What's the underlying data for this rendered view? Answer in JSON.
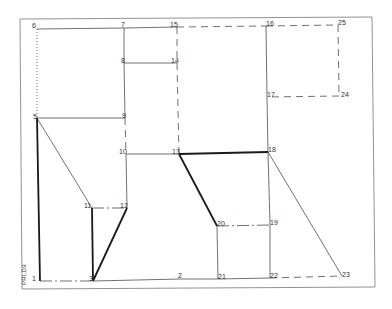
{
  "diagram": {
    "side_label": "PRLD9",
    "colors": {
      "line": "#333333",
      "thick": "#1a1a1a",
      "frame": "#777777",
      "text": "#333333"
    },
    "nodes": [
      {
        "id": "1",
        "x": 40,
        "y": 281,
        "lx": 32,
        "ly": 275
      },
      {
        "id": "2",
        "x": 180,
        "y": 279,
        "lx": 178,
        "ly": 272
      },
      {
        "id": "3",
        "x": 93,
        "y": 281,
        "lx": 89,
        "ly": 275
      },
      {
        "id": "5",
        "x": 37,
        "y": 118,
        "lx": 33,
        "ly": 113
      },
      {
        "id": "6",
        "x": 37,
        "y": 29,
        "lx": 32,
        "ly": 22
      },
      {
        "id": "7",
        "x": 124,
        "y": 28,
        "lx": 121,
        "ly": 21
      },
      {
        "id": "8",
        "x": 124,
        "y": 63,
        "lx": 121,
        "ly": 57
      },
      {
        "id": "9",
        "x": 125,
        "y": 118,
        "lx": 122,
        "ly": 112
      },
      {
        "id": "10",
        "x": 126,
        "y": 154,
        "lx": 119,
        "ly": 148
      },
      {
        "id": "11",
        "x": 92,
        "y": 208,
        "lx": 84,
        "ly": 202
      },
      {
        "id": "12",
        "x": 127,
        "y": 208,
        "lx": 120,
        "ly": 202
      },
      {
        "id": "13",
        "x": 179,
        "y": 154,
        "lx": 172,
        "ly": 148
      },
      {
        "id": "14",
        "x": 177,
        "y": 63,
        "lx": 171,
        "ly": 57
      },
      {
        "id": "15",
        "x": 177,
        "y": 27,
        "lx": 170,
        "ly": 21
      },
      {
        "id": "16",
        "x": 266,
        "y": 26,
        "lx": 266,
        "ly": 20
      },
      {
        "id": "17",
        "x": 267,
        "y": 97,
        "lx": 267,
        "ly": 91
      },
      {
        "id": "18",
        "x": 268,
        "y": 152,
        "lx": 268,
        "ly": 146
      },
      {
        "id": "19",
        "x": 270,
        "y": 225,
        "lx": 270,
        "ly": 219
      },
      {
        "id": "20",
        "x": 217,
        "y": 226,
        "lx": 217,
        "ly": 220
      },
      {
        "id": "21",
        "x": 218,
        "y": 279,
        "lx": 218,
        "ly": 273
      },
      {
        "id": "22",
        "x": 270,
        "y": 278,
        "lx": 270,
        "ly": 272
      },
      {
        "id": "23",
        "x": 342,
        "y": 276,
        "lx": 342,
        "ly": 271
      },
      {
        "id": "24",
        "x": 339,
        "y": 96,
        "lx": 341,
        "ly": 91
      },
      {
        "id": "25",
        "x": 338,
        "y": 25,
        "lx": 338,
        "ly": 19
      }
    ],
    "edges": [
      {
        "from": "6",
        "to": "7",
        "style": "solid"
      },
      {
        "from": "7",
        "to": "15",
        "style": "solid"
      },
      {
        "from": "15",
        "to": "16",
        "style": "dashed"
      },
      {
        "from": "16",
        "to": "25",
        "style": "dashed"
      },
      {
        "from": "25",
        "to": "24",
        "style": "dashed"
      },
      {
        "from": "24",
        "to": "17",
        "style": "dashed"
      },
      {
        "from": "16",
        "to": "17",
        "style": "solid"
      },
      {
        "from": "17",
        "to": "18",
        "style": "solid"
      },
      {
        "from": "6",
        "to": "5",
        "style": "dotted"
      },
      {
        "from": "7",
        "to": "8",
        "style": "solid"
      },
      {
        "from": "8",
        "to": "14",
        "style": "solid"
      },
      {
        "from": "15",
        "to": "14",
        "style": "dashed"
      },
      {
        "from": "14",
        "to": "13",
        "style": "dashed"
      },
      {
        "from": "8",
        "to": "9",
        "style": "solid"
      },
      {
        "from": "5",
        "to": "9",
        "style": "solid"
      },
      {
        "from": "9",
        "to": "10",
        "style": "dashed"
      },
      {
        "from": "10",
        "to": "13",
        "style": "solid"
      },
      {
        "from": "13",
        "to": "18",
        "style": "thick"
      },
      {
        "from": "13",
        "to": "20",
        "style": "thick"
      },
      {
        "from": "10",
        "to": "12",
        "style": "solid"
      },
      {
        "from": "11",
        "to": "12",
        "style": "dashdot"
      },
      {
        "from": "5",
        "to": "11",
        "style": "solid"
      },
      {
        "from": "5",
        "to": "1",
        "style": "thick"
      },
      {
        "from": "11",
        "to": "3",
        "style": "thick"
      },
      {
        "from": "12",
        "to": "3",
        "style": "thick"
      },
      {
        "from": "1",
        "to": "3",
        "style": "dashdot"
      },
      {
        "from": "3",
        "to": "2",
        "style": "solid"
      },
      {
        "from": "2",
        "to": "21",
        "style": "solid"
      },
      {
        "from": "21",
        "to": "22",
        "style": "solid"
      },
      {
        "from": "22",
        "to": "23",
        "style": "dashed"
      },
      {
        "from": "20",
        "to": "19",
        "style": "dashdot"
      },
      {
        "from": "20",
        "to": "21",
        "style": "solid"
      },
      {
        "from": "18",
        "to": "19",
        "style": "solid"
      },
      {
        "from": "19",
        "to": "22",
        "style": "solid"
      },
      {
        "from": "18",
        "to": "23",
        "style": "solid"
      }
    ],
    "frame": {
      "x1": 20,
      "y1": 19,
      "x2": 375,
      "y2": 289
    }
  }
}
